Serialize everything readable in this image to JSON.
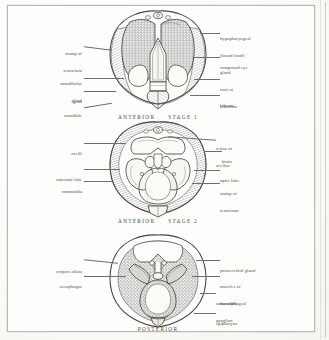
{
  "plate": {
    "description": "Anatomical plate of honeybee head dissections, three views",
    "ink_color": "#4b4b49",
    "paper_color": "#fdfdfb"
  },
  "figures": [
    {
      "id": "stage-1",
      "caption_orientation": "ANTERIOR",
      "caption_stage": "STAGE 1",
      "labels_left": [
        {
          "name": "stump-of-tentorium",
          "lines": [
            "stump of",
            "tentorium"
          ]
        },
        {
          "name": "mandibular-gland",
          "lines": [
            "mandibular",
            "gland"
          ]
        },
        {
          "name": "gena",
          "lines": [
            "gena"
          ]
        },
        {
          "name": "mandible",
          "lines": [
            "mandible"
          ]
        }
      ],
      "labels_right": [
        {
          "name": "hypopharyngeal-gland",
          "lines": [
            "hypopharyngeal",
            "(brood food)",
            "gland"
          ]
        },
        {
          "name": "compound-eye",
          "lines": [
            "compound eye"
          ]
        },
        {
          "name": "roof-of-cibarium",
          "lines": [
            "roof of",
            "cibarium"
          ]
        },
        {
          "name": "labrum",
          "lines": [
            "labrum"
          ]
        }
      ]
    },
    {
      "id": "stage-2",
      "caption_orientation": "ANTERIOR",
      "caption_stage": "STAGE 2",
      "labels_left": [
        {
          "name": "ocelli",
          "lines": [
            "ocelli"
          ]
        },
        {
          "name": "antennal-lobe",
          "lines": [
            "antennal lobe"
          ]
        },
        {
          "name": "ommatidia",
          "lines": [
            "ommatidia"
          ]
        }
      ],
      "labels_right": [
        {
          "name": "retina-of-ocellus",
          "lines": [
            "retina of",
            "ocellus"
          ]
        },
        {
          "name": "brain",
          "lines": [
            "brain"
          ]
        },
        {
          "name": "optic-lobe",
          "lines": [
            "optic lobe"
          ]
        },
        {
          "name": "stump-of-tentorium",
          "lines": [
            "stump of",
            "tentorium"
          ]
        }
      ]
    },
    {
      "id": "posterior",
      "caption_orientation": "POSTERIOR",
      "caption_stage": "",
      "labels_left": [
        {
          "name": "corpora-allata",
          "lines": [
            "corpora allata"
          ]
        },
        {
          "name": "oesophagus",
          "lines": [
            "oesophagus"
          ]
        }
      ],
      "labels_right": [
        {
          "name": "postcerebral-gland",
          "lines": [
            "postcerebral gland"
          ]
        },
        {
          "name": "muscles-of-mandible",
          "lines": [
            "muscles of",
            "mandible"
          ]
        },
        {
          "name": "suboesophageal-ganglion",
          "lines": [
            "suboesophageal",
            "ganglion"
          ]
        },
        {
          "name": "epipharynx",
          "lines": [
            "epipharynx"
          ]
        }
      ]
    }
  ]
}
